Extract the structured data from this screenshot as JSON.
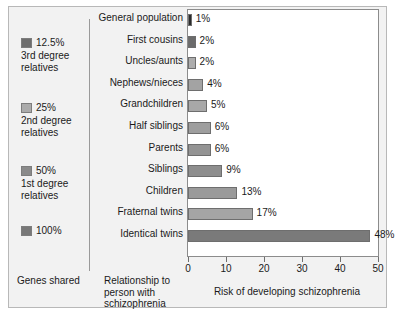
{
  "figure": {
    "genes_shared_label": "Genes shared",
    "relationship_label": "Relationship to person with schizophrenia",
    "risk_label": "Risk of developing schizophrenia"
  },
  "legend": {
    "items": [
      {
        "pct": "12.5%",
        "desc": "3rd degree relatives",
        "color": "#6e6e6e"
      },
      {
        "pct": "25%",
        "desc": "2nd degree relatives",
        "color": "#ababab"
      },
      {
        "pct": "50%",
        "desc": "1st degree relatives",
        "color": "#8a8a8a"
      },
      {
        "pct": "100%",
        "desc": "",
        "color": "#787878"
      }
    ]
  },
  "chart_data": {
    "type": "bar",
    "orientation": "horizontal",
    "title": "",
    "xlabel": "Risk of developing schizophrenia",
    "ylabel": "Relationship to person with schizophrenia",
    "xlim": [
      0,
      50
    ],
    "xticks": [
      0,
      10,
      20,
      30,
      40,
      50
    ],
    "xtick_labels": [
      "0",
      "10",
      "20",
      "30",
      "40",
      "50"
    ],
    "grid": false,
    "legend_position": "left",
    "categories": [
      "General population",
      "First cousins",
      "Uncles/aunts",
      "Nephews/nieces",
      "Grandchildren",
      "Half siblings",
      "Parents",
      "Siblings",
      "Children",
      "Fraternal twins",
      "Identical twins"
    ],
    "values": [
      1,
      2,
      2,
      4,
      5,
      6,
      6,
      9,
      13,
      17,
      48
    ],
    "value_labels": [
      "1%",
      "2%",
      "2%",
      "4%",
      "5%",
      "6%",
      "6%",
      "9%",
      "13%",
      "17%",
      "48%"
    ],
    "bar_colors": [
      "#2b2b2b",
      "#6b6b6b",
      "#adadad",
      "#a3a3a3",
      "#a8a8a8",
      "#9e9e9e",
      "#949494",
      "#8e8e8e",
      "#9a9a9a",
      "#a5a5a5",
      "#7a7a7a"
    ]
  }
}
